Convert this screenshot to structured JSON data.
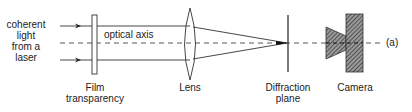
{
  "diagram": {
    "type": "optical-setup",
    "source_label": [
      "coherent",
      "light",
      "from a",
      "laser"
    ],
    "axis_label": "optical axis",
    "components": [
      {
        "id": "film",
        "label_lines": [
          "Film",
          "transparency"
        ]
      },
      {
        "id": "lens",
        "label_lines": [
          "Lens"
        ]
      },
      {
        "id": "diffraction",
        "label_lines": [
          "Diffraction",
          "plane"
        ]
      },
      {
        "id": "camera",
        "label_lines": [
          "Camera"
        ]
      }
    ],
    "panel_tag": "(a)",
    "colors": {
      "line": "#333333",
      "fill_hatch": "#555555",
      "background": "#ffffff"
    }
  }
}
